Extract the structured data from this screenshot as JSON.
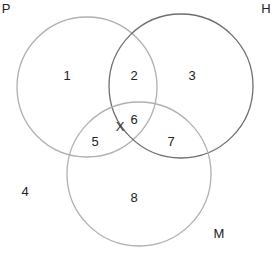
{
  "diagram": {
    "type": "venn",
    "sets": [
      {
        "id": "P",
        "label": "P",
        "cx": 87,
        "cy": 87,
        "r": 70,
        "stroke": "#b0b0b0",
        "label_x": 6,
        "label_y": 8
      },
      {
        "id": "H",
        "label": "H",
        "cx": 181,
        "cy": 86,
        "r": 72,
        "stroke": "#6e6e6e",
        "label_x": 266,
        "label_y": 8
      },
      {
        "id": "M",
        "label": "M",
        "cx": 139,
        "cy": 174,
        "r": 72,
        "stroke": "#b0b0b0",
        "label_x": 219,
        "label_y": 233
      }
    ],
    "regions": [
      {
        "label": "1",
        "x": 67,
        "y": 75
      },
      {
        "label": "2",
        "x": 134,
        "y": 75
      },
      {
        "label": "3",
        "x": 192,
        "y": 75
      },
      {
        "label": "4",
        "x": 25,
        "y": 191
      },
      {
        "label": "5",
        "x": 95,
        "y": 141
      },
      {
        "label": "6",
        "x": 134,
        "y": 119
      },
      {
        "label": "7",
        "x": 171,
        "y": 141
      },
      {
        "label": "8",
        "x": 134,
        "y": 197
      }
    ],
    "marker": {
      "label": "X",
      "x": 120,
      "y": 126
    }
  }
}
